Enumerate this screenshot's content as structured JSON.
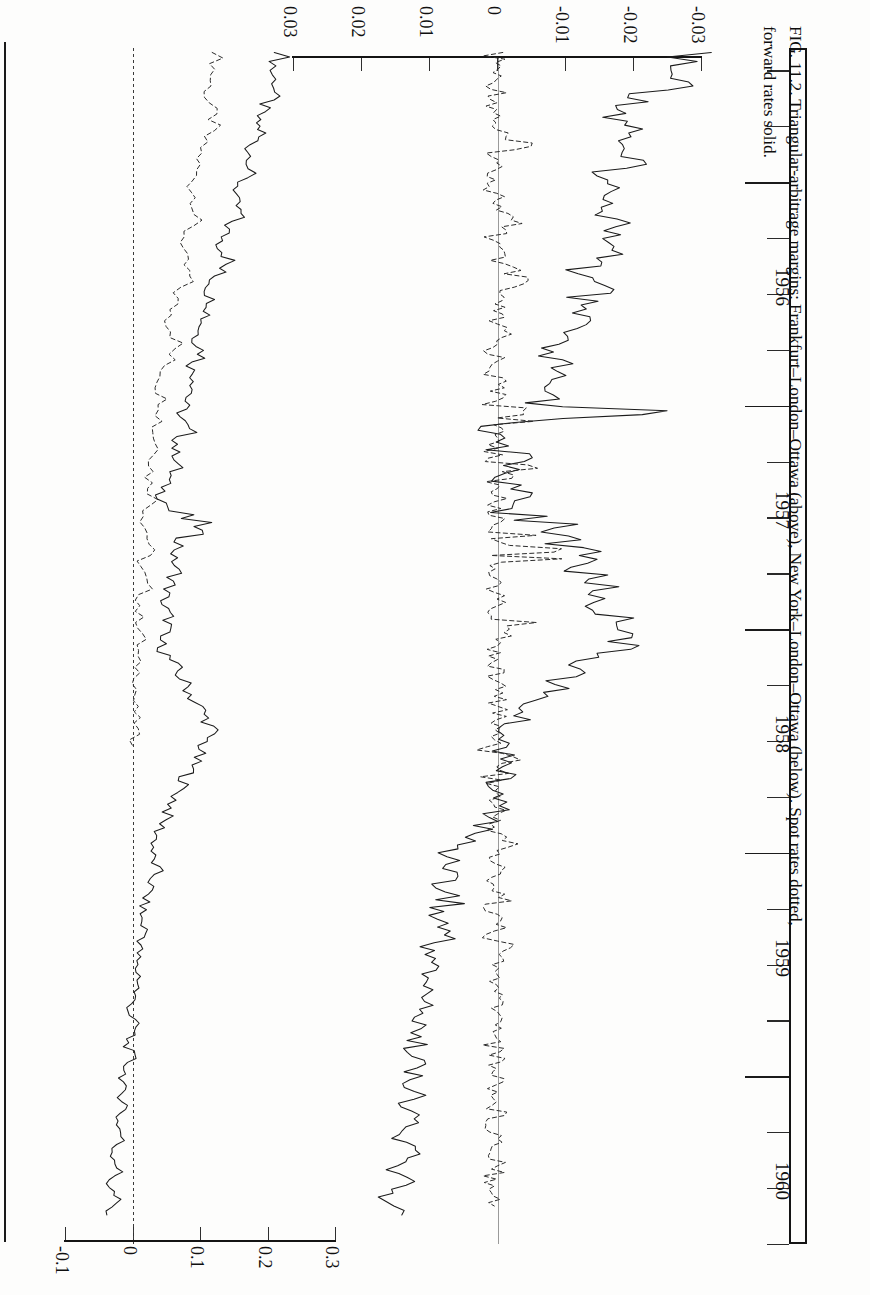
{
  "figure": {
    "number": "FIG. 11.2.",
    "caption_line1": "FIG. 11.2.  Triangular-arbitrage margins:  Frankfurt–London–Ottawa (above), New York–London–Ottawa (below).  Spot rates dotted,",
    "caption_line2": "forward rates solid."
  },
  "time_axis": {
    "label": "Year",
    "years": [
      "1956",
      "1957",
      "1958",
      "1959",
      "1960"
    ],
    "range": [
      1955.4,
      1960.75
    ],
    "major_ticks": [
      "1956",
      "1957",
      "1958",
      "1959",
      "1960"
    ],
    "minor_ticks_per_year": 4
  },
  "upper_chart": {
    "title": "Frankfurt–London–Ottawa",
    "value_axis": {
      "tick_labels": [
        "-0.1",
        "0",
        "0.1",
        "0.2",
        "0.3"
      ],
      "tick_values": [
        -0.1,
        0,
        0.1,
        0.2,
        0.3
      ],
      "range": [
        -0.1,
        0.3
      ]
    },
    "series_names": [
      "Spot rates (dotted)",
      "Forward rates (solid)"
    ]
  },
  "lower_chart": {
    "title": "New York–London–Ottawa",
    "value_axis": {
      "tick_labels": [
        "0.03",
        "0.02",
        "0.01",
        "0",
        "-0.01",
        "-0.02",
        "-0.03"
      ],
      "tick_values": [
        0.03,
        0.02,
        0.01,
        0,
        -0.01,
        -0.02,
        -0.03
      ],
      "range": [
        0.03,
        -0.03
      ]
    },
    "series_names": [
      "Spot rates (dotted)",
      "Forward rates (solid)"
    ]
  },
  "legend": {
    "spot": "Spot rates dotted",
    "forward": "forward rates solid"
  },
  "chart_data": [
    {
      "type": "line",
      "title": "Frankfurt–London–Ottawa triangular-arbitrage margin",
      "orientation": "time-vertical",
      "xlabel": "Margin (per cent)",
      "ylabel": "Year",
      "xlim": [
        -0.1,
        0.3
      ],
      "ylim": [
        1955.4,
        1960.75
      ],
      "grid": false,
      "legend": "Spot rates dotted, forward rates solid",
      "series": [
        {
          "name": "Forward rates (solid)",
          "style": "solid",
          "t": [
            1955.42,
            1955.5,
            1955.58,
            1955.65,
            1955.72,
            1955.78,
            1955.85,
            1955.92,
            1956.0,
            1956.07,
            1956.14,
            1956.21,
            1956.28,
            1956.35,
            1956.42,
            1956.49,
            1956.56,
            1956.63,
            1956.7,
            1956.77,
            1956.84,
            1956.91,
            1956.98,
            1957.05,
            1957.12,
            1957.19,
            1957.26,
            1957.33,
            1957.4,
            1957.47,
            1957.54,
            1957.61,
            1957.68,
            1957.75,
            1957.82,
            1957.89,
            1957.96,
            1958.03,
            1958.1,
            1958.17,
            1958.24,
            1958.31,
            1958.38,
            1958.45,
            1958.52,
            1958.59,
            1958.66,
            1958.73,
            1958.8,
            1958.87,
            1958.94,
            1959.01,
            1959.08,
            1959.15,
            1959.22,
            1959.29,
            1959.36,
            1959.43,
            1959.5,
            1959.57,
            1959.64,
            1959.71,
            1959.78,
            1959.85,
            1959.92,
            1959.99,
            1960.06,
            1960.13,
            1960.2,
            1960.27,
            1960.34,
            1960.41,
            1960.48,
            1960.55,
            1960.62
          ],
          "v": [
            0.225,
            0.206,
            0.214,
            0.196,
            0.183,
            0.19,
            0.172,
            0.178,
            0.16,
            0.15,
            0.158,
            0.14,
            0.131,
            0.142,
            0.122,
            0.112,
            0.12,
            0.104,
            0.095,
            0.106,
            0.088,
            0.096,
            0.079,
            0.07,
            0.082,
            0.062,
            0.068,
            0.051,
            0.044,
            0.056,
            0.1,
            0.073,
            0.06,
            0.066,
            0.052,
            0.045,
            0.056,
            0.04,
            0.047,
            0.062,
            0.078,
            0.09,
            0.106,
            0.118,
            0.104,
            0.092,
            0.08,
            0.068,
            0.056,
            0.044,
            0.034,
            0.028,
            0.036,
            0.026,
            0.018,
            0.012,
            0.02,
            0.01,
            0.004,
            0.012,
            0.002,
            -0.004,
            0.004,
            -0.008,
            -0.002,
            -0.012,
            -0.018,
            -0.01,
            -0.022,
            -0.016,
            -0.028,
            -0.02,
            -0.034,
            -0.026,
            -0.038
          ]
        },
        {
          "name": "Spot rates (dotted)",
          "style": "dotted",
          "t": [
            1955.42,
            1955.52,
            1955.62,
            1955.72,
            1955.82,
            1955.92,
            1956.02,
            1956.12,
            1956.22,
            1956.32,
            1956.42,
            1956.52,
            1956.62,
            1956.72,
            1956.82,
            1956.92,
            1957.02,
            1957.12,
            1957.22,
            1957.32,
            1957.42,
            1957.52,
            1957.62,
            1957.72,
            1957.82,
            1957.92,
            1958.02,
            1958.12,
            1958.22,
            1958.32,
            1958.42,
            1958.52
          ],
          "v": [
            0.128,
            0.118,
            0.11,
            0.121,
            0.104,
            0.096,
            0.088,
            0.098,
            0.08,
            0.072,
            0.082,
            0.064,
            0.055,
            0.066,
            0.048,
            0.04,
            0.05,
            0.032,
            0.04,
            0.024,
            0.032,
            0.018,
            0.026,
            0.012,
            0.02,
            0.008,
            0.015,
            0.005,
            0.01,
            0.002,
            0.006,
            0.0
          ]
        }
      ]
    },
    {
      "type": "line",
      "title": "New York–London–Ottawa triangular-arbitrage margin",
      "orientation": "time-vertical",
      "xlabel": "Margin (per cent)",
      "ylabel": "Year",
      "xlim": [
        0.03,
        -0.03
      ],
      "ylim": [
        1955.4,
        1960.75
      ],
      "grid": false,
      "legend": "Spot rates dotted, forward rates solid",
      "series": [
        {
          "name": "Forward rates (solid)",
          "style": "solid",
          "t": [
            1955.42,
            1955.5,
            1955.57,
            1955.64,
            1955.71,
            1955.78,
            1955.85,
            1955.92,
            1955.99,
            1956.06,
            1956.13,
            1956.2,
            1956.27,
            1956.34,
            1956.41,
            1956.48,
            1956.55,
            1956.62,
            1956.69,
            1956.76,
            1956.83,
            1956.9,
            1956.97,
            1957.04,
            1957.11,
            1957.18,
            1957.25,
            1957.32,
            1957.39,
            1957.46,
            1957.53,
            1957.6,
            1957.67,
            1957.74,
            1957.81,
            1957.88,
            1957.95,
            1958.02,
            1958.09,
            1958.16,
            1958.23,
            1958.3,
            1958.37,
            1958.44,
            1958.51,
            1958.58,
            1958.65,
            1958.72,
            1958.79,
            1958.86,
            1958.93,
            1959.0,
            1959.07,
            1959.14,
            1959.21,
            1959.28,
            1959.35,
            1959.42,
            1959.49,
            1959.56,
            1959.63,
            1959.7,
            1959.77,
            1959.84,
            1959.91,
            1959.98,
            1960.05,
            1960.12,
            1960.19,
            1960.26,
            1960.33,
            1960.4,
            1960.47,
            1960.54,
            1960.62
          ],
          "v": [
            -0.0285,
            -0.025,
            -0.0272,
            -0.0206,
            -0.018,
            -0.0212,
            -0.0168,
            -0.0196,
            -0.0152,
            -0.0178,
            -0.016,
            -0.0188,
            -0.0146,
            -0.0172,
            -0.0118,
            -0.0148,
            -0.0102,
            -0.013,
            -0.0088,
            -0.0064,
            -0.0094,
            -0.0058,
            -0.0082,
            -0.0222,
            0.0012,
            -0.0002,
            -0.004,
            -0.0008,
            -0.0034,
            -0.0018,
            -0.0106,
            -0.0076,
            -0.0142,
            -0.0118,
            -0.0162,
            -0.0138,
            -0.018,
            -0.0206,
            -0.017,
            -0.0132,
            -0.0098,
            -0.006,
            -0.0038,
            -0.0016,
            -0.0004,
            -0.0024,
            -0.0008,
            0.0008,
            -0.0006,
            0.001,
            0.0042,
            0.0072,
            0.0056,
            0.0082,
            0.0062,
            0.0094,
            0.007,
            0.01,
            0.0084,
            0.0112,
            0.0094,
            0.012,
            0.0102,
            0.0126,
            0.0108,
            0.0132,
            0.0116,
            0.014,
            0.012,
            0.0146,
            0.0126,
            0.0152,
            0.0134,
            0.0158,
            0.014
          ]
        },
        {
          "name": "Spot rates (dotted)",
          "style": "dotted",
          "t": [
            1955.42,
            1955.48,
            1955.54,
            1955.6,
            1955.66,
            1955.72,
            1955.78,
            1955.84,
            1955.9,
            1955.96,
            1956.02,
            1956.08,
            1956.14,
            1956.2,
            1956.26,
            1956.32,
            1956.38,
            1956.44,
            1956.5,
            1956.56,
            1956.62,
            1956.68,
            1956.74,
            1956.8,
            1956.86,
            1956.92,
            1956.98,
            1957.04,
            1957.1,
            1957.16,
            1957.22,
            1957.28,
            1957.34,
            1957.4,
            1957.46,
            1957.52,
            1957.58,
            1957.64,
            1957.7,
            1957.76,
            1957.82,
            1957.88,
            1957.94,
            1958.0,
            1958.06,
            1958.12,
            1958.18,
            1958.24,
            1958.3,
            1958.36,
            1958.42,
            1958.48,
            1958.54,
            1958.6,
            1958.66,
            1958.72,
            1958.78,
            1958.84,
            1958.9,
            1958.96,
            1959.02,
            1959.08,
            1959.14,
            1959.2,
            1959.26,
            1959.32,
            1959.38,
            1959.44,
            1959.5,
            1959.56,
            1959.62,
            1959.68,
            1959.74,
            1959.8,
            1959.86,
            1959.92,
            1959.98,
            1960.04,
            1960.1,
            1960.16,
            1960.22,
            1960.28,
            1960.34,
            1960.4,
            1960.46,
            1960.52,
            1960.58
          ],
          "v": [
            0.0008,
            -0.0002,
            0.0006,
            -0.0004,
            0.0004,
            -0.0002,
            0.0006,
            -0.003,
            0.0004,
            -0.0002,
            0.0008,
            -0.0004,
            0.0002,
            -0.0024,
            0.0006,
            -0.0002,
            0.0004,
            -0.0038,
            0.0006,
            -0.0002,
            0.0004,
            -0.0006,
            0.0008,
            -0.0002,
            0.0006,
            -0.0004,
            0.0002,
            -0.006,
            0.0008,
            -0.0002,
            0.0006,
            -0.003,
            0.0004,
            -0.0002,
            0.0006,
            -0.0004,
            0.0004,
            -0.011,
            0.0006,
            -0.0002,
            0.0004,
            -0.0002,
            0.0008,
            -0.0046,
            0.0004,
            -0.0002,
            0.0006,
            -0.0004,
            0.0002,
            -0.0008,
            0.0006,
            -0.0002,
            0.0004,
            -0.0026,
            0.0008,
            -0.0002,
            0.0006,
            -0.0004,
            0.0004,
            -0.0018,
            0.0006,
            -0.0002,
            0.0004,
            -0.0008,
            0.0006,
            -0.0002,
            0.0004,
            -0.0014,
            0.0006,
            -0.0002,
            0.0008,
            -0.0004,
            0.0002,
            -0.001,
            0.0006,
            -0.0002,
            0.0004,
            -0.0006,
            0.0008,
            -0.0002,
            0.0006,
            -0.0004,
            0.0004,
            -0.0012,
            0.0006,
            -0.0002,
            0.0004
          ]
        }
      ]
    }
  ]
}
